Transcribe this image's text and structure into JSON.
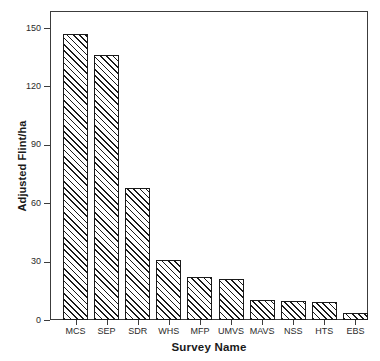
{
  "chart_data": {
    "type": "bar",
    "title": "",
    "xlabel": "Survey Name",
    "ylabel": "Adjusted Flint/ha",
    "categories": [
      "MCS",
      "SEP",
      "SDR",
      "WHS",
      "MFP",
      "UMVS",
      "MAVS",
      "NSS",
      "HTS",
      "EBS"
    ],
    "values": [
      147,
      136,
      68,
      31,
      22,
      21,
      10.5,
      10,
      9.5,
      3.5
    ],
    "ylim": [
      0,
      157
    ],
    "yticks": [
      0,
      30,
      60,
      90,
      120,
      150
    ],
    "ytick_labels": [
      "0",
      "30",
      "60",
      "90",
      "120",
      "150"
    ],
    "grid": false,
    "legend": null,
    "bar_fill": "diagonal-hatch",
    "bar_edge_color": "#1a1a1a",
    "axis_color": "#3c3c3c",
    "background": "#ffffff"
  },
  "axes": {
    "y_title": "Adjusted Flint/ha",
    "x_title": "Survey Name"
  }
}
